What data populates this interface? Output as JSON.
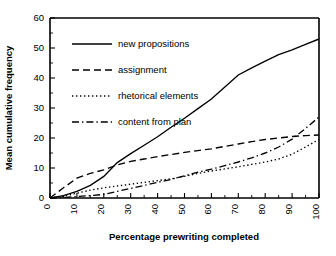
{
  "chart_data": {
    "type": "line",
    "title": "",
    "xlabel": "Percentage prewriting completed",
    "ylabel": "Mean cumulative frequency",
    "xlim": [
      0,
      100
    ],
    "ylim": [
      0,
      60
    ],
    "xticks": [
      0,
      10,
      20,
      30,
      40,
      50,
      60,
      70,
      80,
      90,
      100
    ],
    "yticks": [
      0,
      10,
      20,
      30,
      40,
      50,
      60
    ],
    "xtick_labels": [
      "0",
      "10",
      "20",
      "30",
      "40",
      "50",
      "60",
      "70",
      "80",
      "90",
      "100"
    ],
    "ytick_labels": [
      "0",
      "10",
      "20",
      "30",
      "40",
      "50",
      "60"
    ],
    "xtick_label_rotation": 90,
    "grid": false,
    "legend_position": "upper-left-inside",
    "x": [
      0,
      5,
      10,
      15,
      20,
      25,
      30,
      35,
      40,
      45,
      50,
      55,
      60,
      65,
      70,
      75,
      80,
      85,
      90,
      95,
      100
    ],
    "series": [
      {
        "name": "new propositions",
        "style": "solid",
        "color": "#000000",
        "values": [
          0,
          0.8,
          2.2,
          4.2,
          7.2,
          11.8,
          14.8,
          17.6,
          20.4,
          23.6,
          26.6,
          29.8,
          33.0,
          37.0,
          41.0,
          43.4,
          45.6,
          47.8,
          49.4,
          51.2,
          53.0
        ]
      },
      {
        "name": "assignment",
        "style": "dashed",
        "color": "#000000",
        "values": [
          0,
          3.4,
          6.6,
          8.2,
          9.4,
          11.0,
          12.2,
          13.0,
          13.8,
          14.5,
          15.2,
          15.8,
          16.4,
          17.2,
          18.0,
          18.8,
          19.5,
          20.0,
          20.5,
          20.8,
          21.0
        ]
      },
      {
        "name": "rhetorical elements",
        "style": "dotted",
        "color": "#000000",
        "values": [
          0,
          0.6,
          1.6,
          2.6,
          3.4,
          4.0,
          4.6,
          5.2,
          5.8,
          6.4,
          7.2,
          8.2,
          9.0,
          9.7,
          10.4,
          11.2,
          12.0,
          13.0,
          14.6,
          17.0,
          19.5
        ]
      },
      {
        "name": "content from plan",
        "style": "dashdot",
        "color": "#000000",
        "values": [
          0,
          0.2,
          0.5,
          0.8,
          1.2,
          2.2,
          3.2,
          4.2,
          5.2,
          6.2,
          7.4,
          8.6,
          9.6,
          10.8,
          12.0,
          13.4,
          15.0,
          17.0,
          19.6,
          23.2,
          27.0
        ]
      }
    ],
    "legend": [
      {
        "label": "new propositions",
        "style": "solid"
      },
      {
        "label": "assignment",
        "style": "dashed"
      },
      {
        "label": "rhetorical elements",
        "style": "dotted"
      },
      {
        "label": "content from plan",
        "style": "dashdot"
      }
    ]
  }
}
